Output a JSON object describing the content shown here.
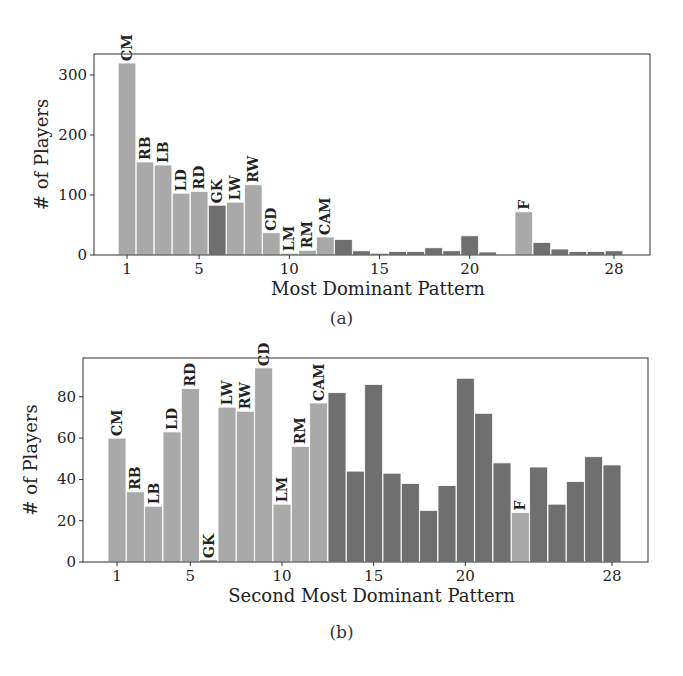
{
  "colors": {
    "labeled": "#a9a9a9",
    "unlabeled": "#6f6f6f",
    "axis": "#333333",
    "bar_edge": "#ffffff"
  },
  "chart_data": [
    {
      "type": "bar",
      "panel": "a",
      "caption": "(a)",
      "xlabel": "Most Dominant Pattern",
      "ylabel": "# of Players",
      "ylim": [
        0,
        340
      ],
      "yticks": [
        0,
        100,
        200,
        300
      ],
      "xticks": [
        1,
        5,
        10,
        15,
        20,
        28
      ],
      "grid": false,
      "legend": null,
      "categories": [
        1,
        2,
        3,
        4,
        5,
        6,
        7,
        8,
        9,
        10,
        11,
        12,
        13,
        14,
        15,
        16,
        17,
        18,
        19,
        20,
        21,
        22,
        23,
        24,
        25,
        26,
        27,
        28
      ],
      "values": [
        320,
        155,
        150,
        103,
        106,
        83,
        88,
        117,
        37,
        3,
        8,
        30,
        26,
        7,
        3,
        6,
        6,
        12,
        7,
        32,
        5,
        1,
        72,
        21,
        10,
        6,
        6,
        7
      ],
      "bar_labels": [
        "CM",
        "RB",
        "LB",
        "LD",
        "RD",
        "GK",
        "LW",
        "RW",
        "CD",
        "LM",
        "RM",
        "CAM",
        "",
        "",
        "",
        "",
        "",
        "",
        "",
        "",
        "",
        "",
        "F",
        "",
        "",
        "",
        "",
        ""
      ],
      "bar_shade": [
        "light",
        "light",
        "light",
        "light",
        "light",
        "dark",
        "light",
        "light",
        "light",
        "light",
        "light",
        "light",
        "dark",
        "dark",
        "dark",
        "dark",
        "dark",
        "dark",
        "dark",
        "dark",
        "dark",
        "dark",
        "light",
        "dark",
        "dark",
        "dark",
        "dark",
        "dark"
      ]
    },
    {
      "type": "bar",
      "panel": "b",
      "caption": "(b)",
      "xlabel": "Second Most Dominant Pattern",
      "ylabel": "# of Players",
      "ylim": [
        0,
        99
      ],
      "yticks": [
        0,
        20,
        40,
        60,
        80
      ],
      "xticks": [
        1,
        5,
        10,
        15,
        20,
        28
      ],
      "grid": false,
      "legend": null,
      "categories": [
        1,
        2,
        3,
        4,
        5,
        6,
        7,
        8,
        9,
        10,
        11,
        12,
        13,
        14,
        15,
        16,
        17,
        18,
        19,
        20,
        21,
        22,
        23,
        24,
        25,
        26,
        27,
        28
      ],
      "values": [
        60,
        34,
        27,
        63,
        84,
        1,
        75,
        73,
        94,
        28,
        56,
        77,
        82,
        44,
        86,
        43,
        38,
        25,
        37,
        89,
        72,
        48,
        24,
        46,
        28,
        39,
        51,
        47
      ],
      "bar_labels": [
        "CM",
        "RB",
        "LB",
        "LD",
        "RD",
        "GK",
        "LW",
        "RW",
        "CD",
        "LM",
        "RM",
        "CAM",
        "",
        "",
        "",
        "",
        "",
        "",
        "",
        "",
        "",
        "",
        "F",
        "",
        "",
        "",
        "",
        ""
      ],
      "bar_shade": [
        "light",
        "light",
        "light",
        "light",
        "light",
        "dark",
        "light",
        "light",
        "light",
        "light",
        "light",
        "light",
        "dark",
        "dark",
        "dark",
        "dark",
        "dark",
        "dark",
        "dark",
        "dark",
        "dark",
        "dark",
        "light",
        "dark",
        "dark",
        "dark",
        "dark",
        "dark"
      ]
    }
  ]
}
